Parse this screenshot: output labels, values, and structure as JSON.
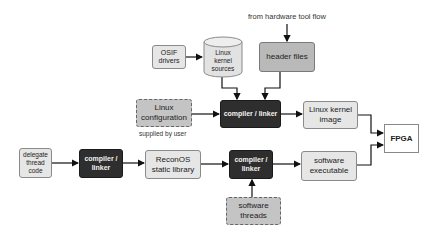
{
  "diagram": {
    "top_label": "from hardware tool flow",
    "supplied_label": "supplied by user",
    "nodes": {
      "osif_drivers": "OSIF drivers",
      "linux_kernel_sources": "Linux kernel sources",
      "header_files": "header files",
      "linux_configuration": "Linux configuration",
      "compiler_linker_top": "compiler / linker",
      "linux_kernel_image": "Linux kernel image",
      "fpga": "FPGA",
      "delegate_thread_code": "delegate thread code",
      "compiler_linker_left": "compiler / linker",
      "reconos_static_library": "ReconOS static library",
      "compiler_linker_bottom": "compiler / linker",
      "software_executable": "software executable",
      "software_threads": "software threads"
    },
    "edges": [
      [
        "from hardware tool flow",
        "header files"
      ],
      [
        "OSIF drivers",
        "Linux kernel sources"
      ],
      [
        "Linux kernel sources",
        "compiler / linker (top)"
      ],
      [
        "header files",
        "compiler / linker (top)"
      ],
      [
        "Linux configuration",
        "compiler / linker (top)"
      ],
      [
        "compiler / linker (top)",
        "Linux kernel image"
      ],
      [
        "Linux kernel image",
        "FPGA"
      ],
      [
        "delegate thread code",
        "compiler / linker (left)"
      ],
      [
        "compiler / linker (left)",
        "ReconOS static library"
      ],
      [
        "ReconOS static library",
        "compiler / linker (bottom)"
      ],
      [
        "software threads",
        "compiler / linker (bottom)"
      ],
      [
        "compiler / linker (bottom)",
        "software executable"
      ],
      [
        "software executable",
        "FPGA"
      ]
    ]
  }
}
